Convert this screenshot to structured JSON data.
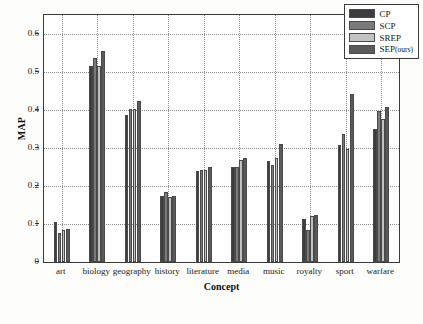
{
  "chart_data": {
    "type": "bar",
    "title": "",
    "xlabel": "Concept",
    "ylabel": "MAP",
    "categories": [
      "art",
      "biology",
      "geography",
      "history",
      "literature",
      "media",
      "music",
      "royalty",
      "sport",
      "warfare"
    ],
    "series": [
      {
        "name": "CP",
        "color": "#3d3d3d",
        "values": [
          0.104,
          0.515,
          0.388,
          0.173,
          0.239,
          0.249,
          0.267,
          0.112,
          0.308,
          0.351
        ]
      },
      {
        "name": "SCP",
        "color": "#7a7a7a",
        "values": [
          0.076,
          0.537,
          0.402,
          0.185,
          0.242,
          0.25,
          0.256,
          0.085,
          0.337,
          0.398
        ]
      },
      {
        "name": "SREP",
        "color": "#c2c2c2",
        "values": [
          0.083,
          0.515,
          0.402,
          0.171,
          0.243,
          0.269,
          0.275,
          0.121,
          0.298,
          0.377
        ]
      },
      {
        "name": "SEP(ours)",
        "color": "#5a5a5a",
        "values": [
          0.087,
          0.554,
          0.425,
          0.175,
          0.249,
          0.274,
          0.31,
          0.125,
          0.443,
          0.408
        ]
      }
    ],
    "ylim": [
      0,
      0.65
    ],
    "yticks": [
      0,
      0.1,
      0.2,
      0.3,
      0.4,
      0.5,
      0.6
    ],
    "ytick_labels": [
      "0",
      "0.1",
      "0.2",
      "0.3",
      "0.4",
      "0.5",
      "0.6"
    ],
    "grid": true,
    "legend_position": "top-right"
  },
  "legend": {
    "entries": [
      {
        "label": "CP"
      },
      {
        "label": "SCP"
      },
      {
        "label": "SREP"
      },
      {
        "label": "SEP(ours)"
      }
    ]
  }
}
